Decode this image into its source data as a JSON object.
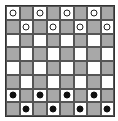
{
  "board": {
    "rows": 8,
    "cols": 8,
    "light_color": "#ffffff",
    "dark_color": "#a8a8a8",
    "pieces": [
      [
        "W",
        "",
        "W",
        "",
        "W",
        "",
        "W",
        ""
      ],
      [
        "",
        "W",
        "",
        "W",
        "",
        "W",
        "",
        "W"
      ],
      [
        "",
        "",
        "",
        "",
        "",
        "",
        "",
        ""
      ],
      [
        "",
        "",
        "",
        "",
        "",
        "",
        "",
        ""
      ],
      [
        "",
        "",
        "",
        "",
        "",
        "",
        "",
        ""
      ],
      [
        "",
        "",
        "",
        "",
        "",
        "",
        "",
        ""
      ],
      [
        "B",
        "",
        "B",
        "",
        "B",
        "",
        "B",
        ""
      ],
      [
        "",
        "B",
        "",
        "B",
        "",
        "B",
        "",
        "B"
      ]
    ]
  }
}
